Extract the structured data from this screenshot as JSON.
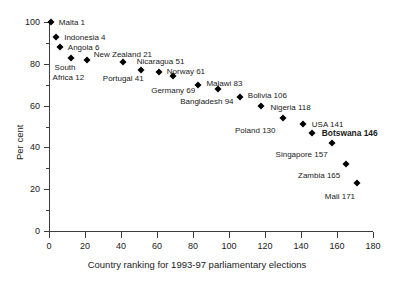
{
  "chart_data": {
    "type": "scatter",
    "title": "",
    "subtitle": "",
    "xlabel": "Country ranking for 1993-97 parliamentary elections",
    "ylabel": "Per cent",
    "xlim": [
      0,
      180
    ],
    "ylim": [
      0,
      100
    ],
    "xticks": [
      0,
      20,
      40,
      60,
      80,
      100,
      120,
      140,
      160,
      180
    ],
    "yticks": [
      0,
      20,
      40,
      60,
      80,
      100
    ],
    "y_minor_ticks": [
      10,
      30,
      50,
      70,
      90
    ],
    "grid": false,
    "legend": "none",
    "marker": "diamond",
    "marker_color": "#000000",
    "points": [
      {
        "label": "Malta 1",
        "x": 1,
        "y": 100
      },
      {
        "label": "Indonesia 4",
        "x": 4,
        "y": 93
      },
      {
        "label": "Angola 6",
        "x": 6,
        "y": 88
      },
      {
        "label": "South\nAfrica 12",
        "x": 12,
        "y": 83
      },
      {
        "label": "New Zealand 21",
        "x": 21,
        "y": 82
      },
      {
        "label": "Portugal 41",
        "x": 41,
        "y": 81
      },
      {
        "label": "Nicaragua 51",
        "x": 51,
        "y": 77
      },
      {
        "label": "Norway 61",
        "x": 61,
        "y": 76
      },
      {
        "label": "Germany 69",
        "x": 69,
        "y": 74
      },
      {
        "label": "Malawi 83",
        "x": 83,
        "y": 70
      },
      {
        "label": "Bangladesh 94",
        "x": 94,
        "y": 68
      },
      {
        "label": "Bolivia 106",
        "x": 106,
        "y": 64
      },
      {
        "label": "Nigeria 118",
        "x": 118,
        "y": 60
      },
      {
        "label": "Poland 130",
        "x": 130,
        "y": 54
      },
      {
        "label": "USA 141",
        "x": 141,
        "y": 51
      },
      {
        "label": "Botswana 146",
        "x": 146,
        "y": 47
      },
      {
        "label": "Singapore 157",
        "x": 157,
        "y": 42
      },
      {
        "label": "Zambia 165",
        "x": 165,
        "y": 32
      },
      {
        "label": "Mali 171",
        "x": 171,
        "y": 23
      }
    ],
    "point_labels": [
      {
        "text": "Malta 1",
        "dx": 8,
        "dy": 0,
        "bold": false
      },
      {
        "text": "Indonesia 4",
        "dx": 8,
        "dy": 0,
        "bold": false
      },
      {
        "text": "Angola 6",
        "dx": 8,
        "dy": 0,
        "bold": false
      },
      {
        "text": "South",
        "dx": -16,
        "dy": 9,
        "bold": false
      },
      {
        "text": "Africa 12",
        "dx": -18,
        "dy": 19,
        "bold": false
      },
      {
        "text": "New Zealand 21",
        "dx": 7,
        "dy": -6,
        "bold": false
      },
      {
        "text": "Portugal 41",
        "dx": -20,
        "dy": 16,
        "bold": false
      },
      {
        "text": "Nicaragua 51",
        "dx": -4,
        "dy": -9,
        "bold": false
      },
      {
        "text": "Norway 61",
        "dx": 8,
        "dy": -1,
        "bold": false
      },
      {
        "text": "Germany 69",
        "dx": -22,
        "dy": 14,
        "bold": false
      },
      {
        "text": "Malawi 83",
        "dx": 8,
        "dy": -2,
        "bold": false
      },
      {
        "text": "Bangladesh 94",
        "dx": -38,
        "dy": 12,
        "bold": false
      },
      {
        "text": "Bolivia 106",
        "dx": 8,
        "dy": -2,
        "bold": false
      },
      {
        "text": "Nigeria 118",
        "dx": 9,
        "dy": 1,
        "bold": false
      },
      {
        "text": "Poland 130",
        "dx": -48,
        "dy": 12,
        "bold": false
      },
      {
        "text": "USA 141",
        "dx": 9,
        "dy": 0,
        "bold": false
      },
      {
        "text": "Botswana 146",
        "dx": 10,
        "dy": 0,
        "bold": true
      },
      {
        "text": "Singapore 157",
        "dx": -56,
        "dy": 11,
        "bold": false
      },
      {
        "text": "Zambia 165",
        "dx": -48,
        "dy": 11,
        "bold": false
      },
      {
        "text": "Mali 171",
        "dx": -32,
        "dy": 13,
        "bold": false
      }
    ]
  }
}
